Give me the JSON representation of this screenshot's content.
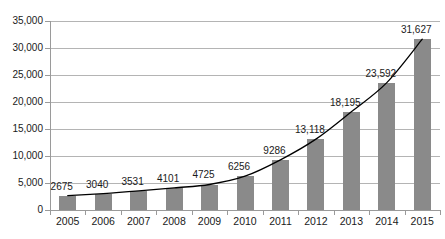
{
  "chart_data": {
    "type": "bar",
    "title": "",
    "xlabel": "",
    "ylabel": "",
    "categories": [
      "2005",
      "2006",
      "2007",
      "2008",
      "2009",
      "2010",
      "2011",
      "2012",
      "2013",
      "2014",
      "2015"
    ],
    "values": [
      2675,
      3040,
      3531,
      4101,
      4725,
      6256,
      9286,
      13118,
      18195,
      23592,
      31627
    ],
    "value_labels": [
      "2675",
      "3040",
      "3531",
      "4101",
      "4725",
      "6256",
      "9286",
      "13,118",
      "18,195",
      "23,592",
      "31,627"
    ],
    "ylim": [
      0,
      35000
    ],
    "ytick_values": [
      0,
      5000,
      10000,
      15000,
      20000,
      25000,
      30000,
      35000
    ],
    "ytick_labels": [
      "0",
      "5,000",
      "10,000",
      "15,000",
      "20,000",
      "25,000",
      "30,000",
      "35,000"
    ],
    "grid": true,
    "legend": false,
    "legend_position": "none",
    "series": [
      {
        "name": "bars",
        "type": "bar",
        "values": [
          2675,
          3040,
          3531,
          4101,
          4725,
          6256,
          9286,
          13118,
          18195,
          23592,
          31627
        ]
      },
      {
        "name": "trend-curve",
        "type": "line",
        "values": [
          2675,
          3040,
          3531,
          4101,
          4725,
          6256,
          9286,
          13118,
          18195,
          23592,
          31627
        ]
      }
    ]
  },
  "style": {
    "bar_color": "#8a8a8a",
    "grid_color": "#b4b4b4",
    "axis_color": "#9a9a9a",
    "line_color": "#000000",
    "text_color": "#1a1a1a",
    "background": "#ffffff"
  }
}
